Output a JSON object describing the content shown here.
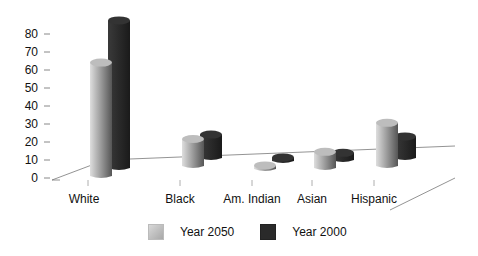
{
  "chart_data": {
    "type": "bar",
    "style": "3d-clustered",
    "title": "",
    "xlabel": "",
    "ylabel": "",
    "ylim": [
      0,
      80
    ],
    "yticks": [
      0,
      10,
      20,
      30,
      40,
      50,
      60,
      70,
      80
    ],
    "categories": [
      "White",
      "Black",
      "Am. Indian",
      "Asian",
      "Hispanic"
    ],
    "series": [
      {
        "name": "Year 2050",
        "color": "#b0b0b0",
        "values": [
          63,
          15,
          1,
          9,
          24
        ]
      },
      {
        "name": "Year 2000",
        "color": "#2a2a2a",
        "values": [
          82,
          13,
          1,
          4,
          12
        ]
      }
    ],
    "legend_position": "bottom",
    "grid": false
  },
  "axis": {
    "y_ticks": [
      "0",
      "10",
      "20",
      "30",
      "40",
      "50",
      "60",
      "70",
      "80"
    ]
  },
  "legend": [
    {
      "label": "Year 2050"
    },
    {
      "label": "Year 2000"
    }
  ]
}
